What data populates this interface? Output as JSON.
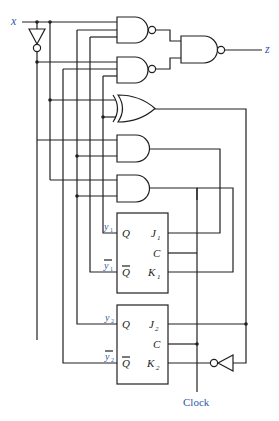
{
  "diagram": {
    "type": "sequential-circuit",
    "colors": {
      "line": "#231f20",
      "label": "#2e5aa8"
    },
    "input": {
      "label": "x"
    },
    "output": {
      "label": "z"
    },
    "clock": {
      "label": "Clock"
    },
    "gates": [
      {
        "id": "inv-x",
        "type": "NOT",
        "input": "x",
        "output": "x'"
      },
      {
        "id": "nand1",
        "type": "NAND",
        "output_to": "nand-out"
      },
      {
        "id": "nand2",
        "type": "NAND",
        "output_to": "nand-out"
      },
      {
        "id": "nand-out",
        "type": "NAND",
        "output_to": "z"
      },
      {
        "id": "xor1",
        "type": "XOR",
        "output_to": "K2-inverter / J2"
      },
      {
        "id": "and1",
        "type": "AND",
        "output_to": "J1"
      },
      {
        "id": "and2",
        "type": "AND",
        "output_to": "K1"
      },
      {
        "id": "inv-k2",
        "type": "NOT",
        "output_to": "K2"
      }
    ],
    "flipflops": [
      {
        "id": "ff1",
        "type": "JK",
        "q_label": "Q",
        "qbar_label": "Q",
        "j_label": "J",
        "j_sub": "1",
        "c_label": "C",
        "k_label": "K",
        "k_sub": "1",
        "out_label": "y",
        "out_sub": "1",
        "outbar_label": "y",
        "outbar_sub": "1"
      },
      {
        "id": "ff2",
        "type": "JK",
        "q_label": "Q",
        "qbar_label": "Q",
        "j_label": "J",
        "j_sub": "2",
        "c_label": "C",
        "k_label": "K",
        "k_sub": "2",
        "out_label": "y",
        "out_sub": "2",
        "outbar_label": "y",
        "outbar_sub": "2"
      }
    ]
  }
}
